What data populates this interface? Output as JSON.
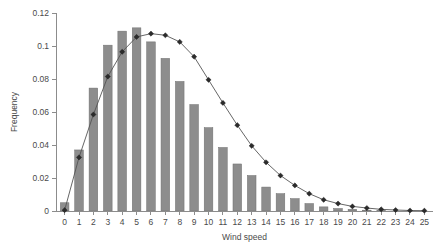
{
  "chart_data": {
    "type": "bar",
    "title": "",
    "subtitle": "",
    "xlabel": "Wind speed",
    "ylabel": "Frequency",
    "xlim": [
      -0.6,
      25.6
    ],
    "ylim": [
      0,
      0.12
    ],
    "grid": false,
    "legend": null,
    "x_ticks": [
      0,
      1,
      2,
      3,
      4,
      5,
      6,
      7,
      8,
      9,
      10,
      11,
      12,
      13,
      14,
      15,
      16,
      17,
      18,
      19,
      20,
      21,
      22,
      23,
      24,
      25
    ],
    "x_tick_labels": [
      "0",
      "1",
      "2",
      "3",
      "4",
      "5",
      "6",
      "7",
      "8",
      "9",
      "10",
      "11",
      "12",
      "13",
      "14",
      "15",
      "16",
      "17",
      "18",
      "19",
      "20",
      "21",
      "22",
      "23",
      "24",
      "25"
    ],
    "y_ticks": [
      0,
      0.02,
      0.04,
      0.06,
      0.08,
      0.1,
      0.12
    ],
    "y_tick_labels": [
      "0",
      "0.02",
      "0.04",
      "0.06",
      "0.08",
      "0.1",
      "0.12"
    ],
    "categories": [
      "0",
      "1",
      "2",
      "3",
      "4",
      "5",
      "6",
      "7",
      "8",
      "9",
      "10",
      "11",
      "12",
      "13",
      "14",
      "15",
      "16",
      "17",
      "18",
      "19",
      "20",
      "21",
      "22",
      "23",
      "24",
      "25"
    ],
    "series": [
      {
        "name": "Observed frequency",
        "type": "bar",
        "color": "#8d8d8d",
        "values": [
          0.005,
          0.037,
          0.0745,
          0.1005,
          0.109,
          0.111,
          0.1025,
          0.0925,
          0.0785,
          0.0645,
          0.0505,
          0.0385,
          0.0285,
          0.0215,
          0.0145,
          0.0105,
          0.0075,
          0.0045,
          0.0025,
          0.0015,
          0.001,
          0.0005,
          0.0003,
          0.0002,
          0.0001,
          0.0001
        ]
      },
      {
        "name": "Fitted distribution",
        "type": "line",
        "color": "#2b2b2b",
        "marker": "diamond",
        "values": [
          0.0005,
          0.0325,
          0.0585,
          0.0815,
          0.0965,
          0.1055,
          0.1075,
          0.1065,
          0.1025,
          0.0935,
          0.0795,
          0.0655,
          0.052,
          0.0395,
          0.0295,
          0.0215,
          0.0155,
          0.0105,
          0.0068,
          0.0045,
          0.0028,
          0.0018,
          0.001,
          0.0006,
          0.0003,
          0.0002
        ]
      }
    ]
  }
}
